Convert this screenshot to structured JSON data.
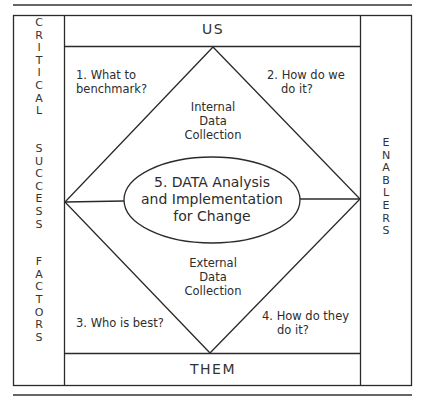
{
  "diagram": {
    "top_label": "US",
    "bottom_label": "THEM",
    "left_column": {
      "words": [
        "CRITICAL",
        "SUCCESS",
        "FACTORS"
      ]
    },
    "right_column": {
      "words": [
        "ENABLERS"
      ]
    },
    "quadrants": {
      "q1": {
        "line1": "1. What to",
        "line2": "benchmark?"
      },
      "q2": {
        "line1": "2. How do we",
        "line2": "do it?"
      },
      "q3": {
        "line1": "3. Who is best?"
      },
      "q4": {
        "line1": "4. How do they",
        "line2": "do it?"
      }
    },
    "internal": {
      "line1": "Internal",
      "line2": "Data",
      "line3": "Collection"
    },
    "external": {
      "line1": "External",
      "line2": "Data",
      "line3": "Collection"
    },
    "center": {
      "line1": "5. DATA Analysis",
      "line2": "and Implementation",
      "line3": "for Change"
    },
    "colors": {
      "stroke": "#2a2a2a",
      "text": "#2d2d2d",
      "background": "#ffffff"
    }
  }
}
